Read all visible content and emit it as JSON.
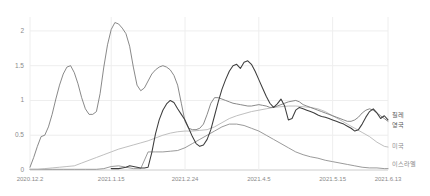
{
  "chart_data": {
    "type": "line",
    "title": "",
    "subtitle": "",
    "xlabel": "",
    "ylabel": "",
    "grid": true,
    "legend_position": "right-inline",
    "ylim": [
      0,
      2.2
    ],
    "yticks": [
      "0",
      "0.5",
      "1",
      "1.5",
      "2"
    ],
    "ytick_values": [
      0,
      0.5,
      1,
      1.5,
      2
    ],
    "xticks": [
      "2020.12.2",
      "2021.1.15",
      "2021.2.24",
      "2021.4.5",
      "2021.5.15",
      "2021.6.13"
    ],
    "xtick_positions": [
      0,
      44,
      84,
      124,
      164,
      194
    ],
    "xlim": [
      0,
      194
    ],
    "x_unit": "days",
    "series": [
      {
        "name": "칠레",
        "color": "#3d3d3d",
        "label_y": 0.8,
        "x": [
          44,
          46,
          48,
          50,
          52,
          54,
          56,
          58,
          60,
          62,
          64,
          66,
          68,
          70,
          72,
          74,
          76,
          78,
          80,
          82,
          84,
          86,
          88,
          90,
          92,
          94,
          96,
          98,
          100,
          102,
          104,
          106,
          108,
          110,
          112,
          114,
          116,
          118,
          120,
          122,
          124,
          126,
          128,
          130,
          132,
          134,
          136,
          138,
          140,
          142,
          144,
          146,
          148,
          150,
          152,
          154,
          156,
          158,
          160,
          162,
          164,
          166,
          168,
          170,
          172,
          174,
          176,
          178,
          180,
          182,
          184,
          186,
          188,
          190,
          192,
          194
        ],
        "values": [
          0.02,
          0.02,
          0.02,
          0.03,
          0.04,
          0.06,
          0.05,
          0.04,
          0.03,
          0.03,
          0.04,
          0.25,
          0.52,
          0.72,
          0.86,
          0.95,
          1.0,
          0.97,
          0.88,
          0.8,
          0.72,
          0.6,
          0.48,
          0.38,
          0.34,
          0.36,
          0.44,
          0.58,
          0.78,
          0.98,
          1.16,
          1.3,
          1.42,
          1.5,
          1.52,
          1.46,
          1.55,
          1.57,
          1.52,
          1.42,
          1.3,
          1.18,
          1.06,
          0.96,
          0.9,
          0.95,
          1.02,
          0.92,
          0.72,
          0.74,
          0.86,
          0.9,
          0.88,
          0.86,
          0.84,
          0.82,
          0.79,
          0.77,
          0.76,
          0.74,
          0.72,
          0.7,
          0.68,
          0.66,
          0.63,
          0.6,
          0.56,
          0.58,
          0.66,
          0.76,
          0.84,
          0.88,
          0.82,
          0.74,
          0.78,
          0.72
        ]
      },
      {
        "name": "영국",
        "color": "#747474",
        "label_y": 0.66,
        "x": [
          0,
          2,
          4,
          6,
          8,
          10,
          12,
          14,
          16,
          18,
          20,
          22,
          24,
          26,
          28,
          30,
          32,
          34,
          36,
          38,
          40,
          42,
          44,
          46,
          48,
          50,
          52,
          54,
          56,
          58,
          60,
          62,
          64,
          66,
          68,
          70,
          72,
          74,
          76,
          78,
          80,
          82,
          84,
          86,
          88,
          90,
          92,
          94,
          96,
          98,
          100,
          102,
          104,
          106,
          108,
          110,
          112,
          114,
          116,
          118,
          120,
          122,
          124,
          126,
          128,
          130,
          132,
          134,
          136,
          138,
          140,
          142,
          144,
          146,
          148,
          150,
          152,
          154,
          156,
          158,
          160,
          162,
          164,
          166,
          168,
          170,
          172,
          174,
          176,
          178,
          180,
          182,
          184,
          186,
          188,
          190,
          192,
          194
        ],
        "values": [
          0.04,
          0.18,
          0.34,
          0.48,
          0.5,
          0.62,
          0.8,
          1.02,
          1.22,
          1.38,
          1.48,
          1.5,
          1.4,
          1.24,
          1.04,
          0.88,
          0.8,
          0.8,
          0.84,
          1.1,
          1.48,
          1.8,
          2.02,
          2.12,
          2.1,
          2.04,
          1.96,
          1.78,
          1.48,
          1.22,
          1.14,
          1.18,
          1.28,
          1.38,
          1.44,
          1.48,
          1.5,
          1.48,
          1.44,
          1.36,
          1.22,
          0.96,
          0.7,
          0.6,
          0.58,
          0.58,
          0.6,
          0.66,
          0.8,
          0.96,
          1.04,
          1.04,
          1.02,
          1.0,
          0.98,
          0.96,
          0.95,
          0.94,
          0.93,
          0.92,
          0.92,
          0.93,
          0.94,
          0.93,
          0.92,
          0.9,
          0.9,
          0.92,
          0.94,
          0.96,
          0.98,
          0.99,
          1.0,
          0.98,
          0.94,
          0.92,
          0.9,
          0.88,
          0.86,
          0.84,
          0.82,
          0.8,
          0.78,
          0.76,
          0.74,
          0.72,
          0.7,
          0.7,
          0.72,
          0.76,
          0.82,
          0.86,
          0.88,
          0.86,
          0.82,
          0.78,
          0.74,
          0.7
        ]
      },
      {
        "name": "미국",
        "color": "#b4b4b4",
        "label_y": 0.36,
        "x": [
          0,
          4,
          8,
          12,
          16,
          20,
          24,
          28,
          32,
          36,
          40,
          44,
          48,
          52,
          56,
          60,
          64,
          68,
          72,
          76,
          80,
          84,
          88,
          92,
          96,
          100,
          104,
          108,
          112,
          116,
          120,
          124,
          128,
          132,
          136,
          140,
          144,
          148,
          152,
          156,
          160,
          164,
          168,
          172,
          176,
          180,
          184,
          188,
          192,
          194
        ],
        "values": [
          0.01,
          0.01,
          0.02,
          0.03,
          0.04,
          0.05,
          0.06,
          0.1,
          0.14,
          0.18,
          0.22,
          0.26,
          0.3,
          0.33,
          0.36,
          0.39,
          0.42,
          0.46,
          0.5,
          0.53,
          0.55,
          0.56,
          0.56,
          0.57,
          0.58,
          0.62,
          0.68,
          0.74,
          0.78,
          0.81,
          0.84,
          0.86,
          0.88,
          0.9,
          0.91,
          0.92,
          0.92,
          0.91,
          0.9,
          0.88,
          0.84,
          0.78,
          0.72,
          0.66,
          0.6,
          0.54,
          0.48,
          0.4,
          0.34,
          0.33
        ]
      },
      {
        "name": "이스라엘",
        "color": "#888888",
        "label_y": 0.1,
        "x": [
          0,
          6,
          12,
          18,
          24,
          30,
          36,
          40,
          44,
          48,
          52,
          56,
          60,
          64,
          68,
          72,
          76,
          80,
          84,
          88,
          92,
          96,
          100,
          104,
          108,
          112,
          116,
          120,
          124,
          128,
          132,
          136,
          140,
          144,
          148,
          152,
          156,
          160,
          164,
          168,
          172,
          176,
          180,
          184,
          188,
          192,
          194
        ],
        "values": [
          0.01,
          0.01,
          0.01,
          0.01,
          0.01,
          0.01,
          0.01,
          0.02,
          0.05,
          0.06,
          0.04,
          0.02,
          0.02,
          0.26,
          0.26,
          0.26,
          0.27,
          0.28,
          0.32,
          0.38,
          0.44,
          0.5,
          0.56,
          0.62,
          0.66,
          0.66,
          0.64,
          0.6,
          0.56,
          0.5,
          0.44,
          0.38,
          0.32,
          0.26,
          0.22,
          0.19,
          0.17,
          0.14,
          0.12,
          0.1,
          0.08,
          0.06,
          0.04,
          0.03,
          0.03,
          0.02,
          0.02
        ]
      }
    ]
  },
  "axis": {
    "axis_color": "#cccccc",
    "grid_color": "#eeeeee",
    "tick_text_color": "#8a8a8a"
  },
  "geometry": {
    "plot_left": 30,
    "plot_right": 388,
    "plot_top": 17,
    "plot_bottom": 170,
    "label_x": 392
  }
}
